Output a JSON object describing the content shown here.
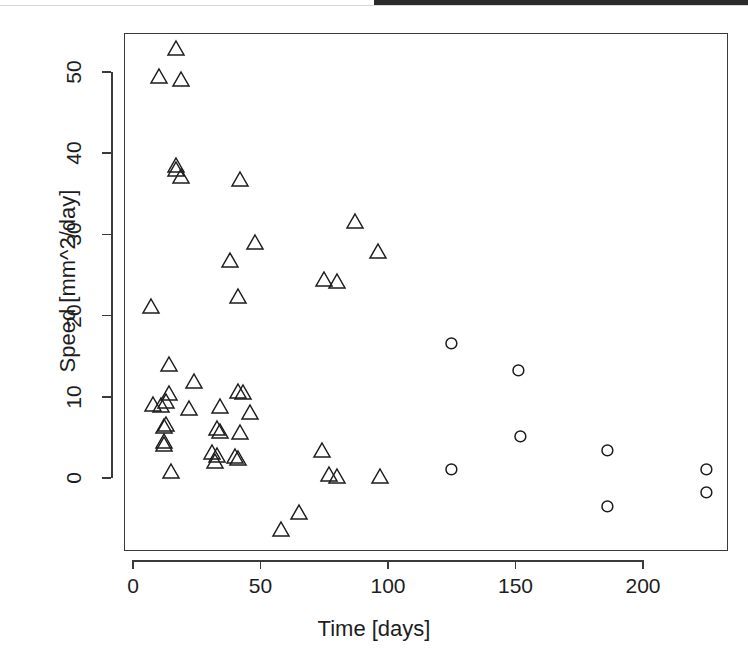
{
  "figure": {
    "kind": "scatter-plot",
    "background_color": "#ffffff",
    "foreground_color": "#1c1c1c"
  },
  "scan_artifact": {
    "top_bar_color": "#2b2b2b"
  },
  "axes": {
    "x_title": "Time [days]",
    "y_title": "Speed [mm^2/day]",
    "x_ticks": [
      "0",
      "50",
      "100",
      "150",
      "200"
    ],
    "y_ticks": [
      "0",
      "10",
      "20",
      "30",
      "40",
      "50"
    ]
  },
  "chart_data": {
    "type": "scatter",
    "title": "",
    "xlabel": "Time [days]",
    "ylabel": "Speed [mm^2/day]",
    "xlim": [
      -4,
      234
    ],
    "ylim": [
      -8.5,
      55.5
    ],
    "xticks": [
      0,
      50,
      100,
      150,
      200
    ],
    "yticks": [
      0,
      10,
      20,
      30,
      40,
      50
    ],
    "grid": false,
    "legend": "none",
    "series": [
      {
        "name": "triangle-group",
        "marker": "triangle",
        "color": "#1c1c1c",
        "points": [
          {
            "x": 17,
            "y": 52.8
          },
          {
            "x": 10,
            "y": 49.3
          },
          {
            "x": 19,
            "y": 48.9
          },
          {
            "x": 17,
            "y": 38.3
          },
          {
            "x": 17,
            "y": 37.9
          },
          {
            "x": 19,
            "y": 37.0
          },
          {
            "x": 42,
            "y": 36.6
          },
          {
            "x": 87,
            "y": 31.5
          },
          {
            "x": 48,
            "y": 28.8
          },
          {
            "x": 96,
            "y": 27.8
          },
          {
            "x": 38,
            "y": 26.7
          },
          {
            "x": 75,
            "y": 24.3
          },
          {
            "x": 80,
            "y": 24.1
          },
          {
            "x": 41,
            "y": 22.2
          },
          {
            "x": 7,
            "y": 21.0
          },
          {
            "x": 14,
            "y": 13.8
          },
          {
            "x": 24,
            "y": 11.7
          },
          {
            "x": 41,
            "y": 10.5
          },
          {
            "x": 43,
            "y": 10.4
          },
          {
            "x": 14,
            "y": 10.3
          },
          {
            "x": 13,
            "y": 9.3
          },
          {
            "x": 8,
            "y": 8.9
          },
          {
            "x": 11,
            "y": 8.8
          },
          {
            "x": 22,
            "y": 8.4
          },
          {
            "x": 34,
            "y": 8.6
          },
          {
            "x": 46,
            "y": 7.9
          },
          {
            "x": 13,
            "y": 6.5
          },
          {
            "x": 12,
            "y": 6.2
          },
          {
            "x": 33,
            "y": 6.0
          },
          {
            "x": 34,
            "y": 5.6
          },
          {
            "x": 42,
            "y": 5.4
          },
          {
            "x": 12,
            "y": 4.4
          },
          {
            "x": 12,
            "y": 4.0
          },
          {
            "x": 31,
            "y": 3.0
          },
          {
            "x": 33,
            "y": 2.6
          },
          {
            "x": 74,
            "y": 3.3
          },
          {
            "x": 32,
            "y": 1.9
          },
          {
            "x": 40,
            "y": 2.5
          },
          {
            "x": 41,
            "y": 2.3
          },
          {
            "x": 15,
            "y": 0.6
          },
          {
            "x": 77,
            "y": 0.3
          },
          {
            "x": 80,
            "y": 0.1
          },
          {
            "x": 97,
            "y": 0.1
          },
          {
            "x": 65,
            "y": -4.4
          },
          {
            "x": 58,
            "y": -6.5
          }
        ]
      },
      {
        "name": "circle-group",
        "marker": "circle",
        "color": "#1c1c1c",
        "points": [
          {
            "x": 125,
            "y": 16.6
          },
          {
            "x": 151,
            "y": 13.2
          },
          {
            "x": 152,
            "y": 5.1
          },
          {
            "x": 186,
            "y": 3.4
          },
          {
            "x": 125,
            "y": 1.0
          },
          {
            "x": 225,
            "y": 1.1
          },
          {
            "x": 186,
            "y": -3.5
          },
          {
            "x": 225,
            "y": -1.8
          }
        ]
      }
    ]
  }
}
